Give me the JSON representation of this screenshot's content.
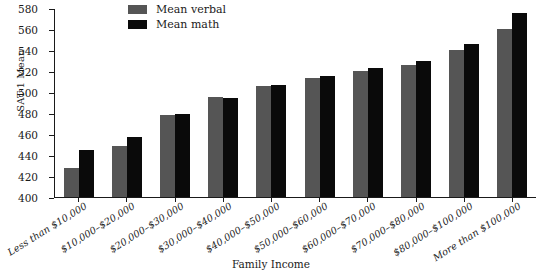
{
  "chart_data": {
    "type": "bar",
    "title": "",
    "xlabel": "Family Income",
    "ylabel": "SAT-1 Mean",
    "ylim": [
      400,
      580
    ],
    "ytick_step": 20,
    "yticks": [
      400,
      420,
      440,
      460,
      480,
      500,
      520,
      540,
      560,
      580
    ],
    "grid": false,
    "legend_position": "top-center",
    "categories": [
      "Less than $10,000",
      "$10,000–$20,000",
      "$20,000–$30,000",
      "$30,000–$40,000",
      "$40,000–$50,000",
      "$50,000–$60,000",
      "$60,000–$70,000",
      "$70,000–$80,000",
      "$80,000–$100,000",
      "More than $100,000"
    ],
    "series": [
      {
        "name": "Mean verbal",
        "color": "#555555",
        "values": [
          428,
          449,
          478,
          495,
          506,
          513,
          520,
          526,
          540,
          560
        ]
      },
      {
        "name": "Mean math",
        "color": "#0a0a0a",
        "values": [
          445,
          457,
          479,
          494,
          507,
          515,
          523,
          530,
          546,
          575
        ]
      }
    ]
  },
  "legend": {
    "items": [
      {
        "label": "Mean verbal",
        "swatch": "legend-swatch-verbal"
      },
      {
        "label": "Mean math",
        "swatch": "legend-swatch-math"
      }
    ]
  }
}
